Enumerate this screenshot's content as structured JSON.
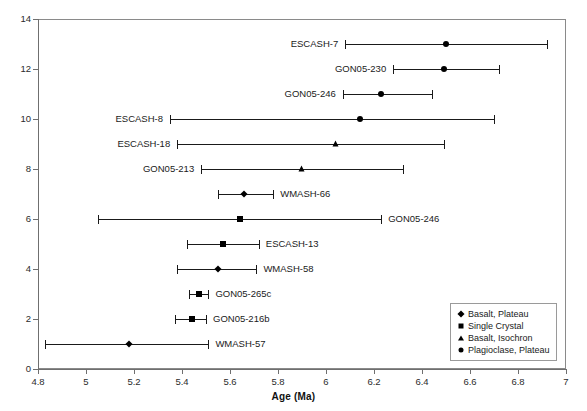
{
  "chart_data": {
    "type": "scatter",
    "title": "",
    "xlabel": "Age (Ma)",
    "ylabel": "",
    "xlim": [
      4.8,
      7.0
    ],
    "ylim": [
      0,
      14
    ],
    "grid": false,
    "legend_position": "bottom-right",
    "x_ticks": [
      "4.8",
      "5",
      "5.2",
      "5.4",
      "5.6",
      "5.8",
      "6",
      "6.2",
      "6.4",
      "6.6",
      "6.8",
      "7"
    ],
    "x_tick_values": [
      4.8,
      5.0,
      5.2,
      5.4,
      5.6,
      5.8,
      6.0,
      6.2,
      6.4,
      6.6,
      6.8,
      7.0
    ],
    "y_ticks": [
      "0",
      "2",
      "4",
      "6",
      "8",
      "10",
      "12",
      "14"
    ],
    "y_tick_values": [
      0,
      2,
      4,
      6,
      8,
      10,
      12,
      14
    ],
    "legend": [
      {
        "label": "Basalt, Plateau",
        "marker": "diamond"
      },
      {
        "label": "Single Crystal",
        "marker": "square"
      },
      {
        "label": "Basalt, Isochron",
        "marker": "triangle"
      },
      {
        "label": "Plagioclase, Plateau",
        "marker": "circle"
      }
    ],
    "points": [
      {
        "label": "ESCASH-7",
        "y": 13,
        "x": 6.5,
        "low": 6.08,
        "high": 6.92,
        "marker": "circle",
        "label_side": "left"
      },
      {
        "label": "GON05-230",
        "y": 12,
        "x": 6.49,
        "low": 6.28,
        "high": 6.72,
        "marker": "circle",
        "label_side": "left"
      },
      {
        "label": "GON05-246",
        "y": 11,
        "x": 6.23,
        "low": 6.07,
        "high": 6.44,
        "marker": "circle",
        "label_side": "left"
      },
      {
        "label": "ESCASH-8",
        "y": 10,
        "x": 6.14,
        "low": 5.35,
        "high": 6.7,
        "marker": "circle",
        "label_side": "left"
      },
      {
        "label": "ESCASH-18",
        "y": 9,
        "x": 6.04,
        "low": 5.38,
        "high": 6.49,
        "marker": "triangle",
        "label_side": "left"
      },
      {
        "label": "GON05-213",
        "y": 8,
        "x": 5.9,
        "low": 5.48,
        "high": 6.32,
        "marker": "triangle",
        "label_side": "left"
      },
      {
        "label": "WMASH-66",
        "y": 7,
        "x": 5.66,
        "low": 5.55,
        "high": 5.78,
        "marker": "diamond",
        "label_side": "right"
      },
      {
        "label": "GON05-246",
        "y": 6,
        "x": 5.64,
        "low": 5.05,
        "high": 6.23,
        "marker": "square",
        "label_side": "right"
      },
      {
        "label": "ESCASH-13",
        "y": 5,
        "x": 5.57,
        "low": 5.42,
        "high": 5.72,
        "marker": "square",
        "label_side": "right"
      },
      {
        "label": "WMASH-58",
        "y": 4,
        "x": 5.55,
        "low": 5.38,
        "high": 5.71,
        "marker": "diamond",
        "label_side": "right"
      },
      {
        "label": "GON05-265c",
        "y": 3,
        "x": 5.47,
        "low": 5.43,
        "high": 5.51,
        "marker": "square",
        "label_side": "right"
      },
      {
        "label": "GON05-216b",
        "y": 2,
        "x": 5.44,
        "low": 5.37,
        "high": 5.5,
        "marker": "square",
        "label_side": "right"
      },
      {
        "label": "WMASH-57",
        "y": 1,
        "x": 5.18,
        "low": 4.83,
        "high": 5.51,
        "marker": "diamond",
        "label_side": "right"
      }
    ]
  }
}
